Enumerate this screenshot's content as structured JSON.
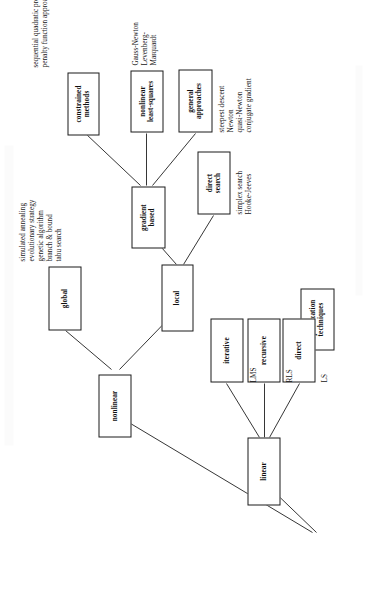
{
  "figure": {
    "orientation": "rotated-90-ccw",
    "root": {
      "id": "root",
      "label": "optimization\ntechniques"
    },
    "nodes": [
      {
        "id": "root",
        "label": "optimization\ntechniques"
      },
      {
        "id": "linear",
        "label": "linear"
      },
      {
        "id": "nonlinear",
        "label": "nonlinear"
      },
      {
        "id": "lin-direct",
        "label": "direct"
      },
      {
        "id": "lin-recursive",
        "label": "recursive"
      },
      {
        "id": "lin-iterative",
        "label": "iterative"
      },
      {
        "id": "global",
        "label": "global"
      },
      {
        "id": "local",
        "label": "local"
      },
      {
        "id": "dir-search",
        "label": "direct\nsearch"
      },
      {
        "id": "grad-based",
        "label": "gradient\nbased"
      },
      {
        "id": "gen-approach",
        "label": "general\napproaches"
      },
      {
        "id": "nl-lsq",
        "label": "nonlinear\nleast-squares"
      },
      {
        "id": "constrained",
        "label": "constrained\nmethods"
      }
    ],
    "leaves": {
      "lin_direct": "LS",
      "lin_recursive": "RLS",
      "lin_iterative": "LMS",
      "global": "simulated annealing\nevolutionary strategy\ngenetic algorithm\nbranch & bound\ntabu search",
      "direct_search": "simplex search\nHooke-Jeeves",
      "general_approaches": "steepest descent\nNewton\nquasi-Newton\nconjugate gradient",
      "nonlinear_least_squares": "Gauss-Newton\nLevenberg-\nMarquardt",
      "constrained_methods": "sequential quadratic programming\npenalty function approaches"
    },
    "edges": [
      {
        "from": "root",
        "to": "linear"
      },
      {
        "from": "root",
        "to": "nonlinear"
      },
      {
        "from": "linear",
        "to": "lin-direct"
      },
      {
        "from": "linear",
        "to": "lin-recursive"
      },
      {
        "from": "linear",
        "to": "lin-iterative"
      },
      {
        "from": "nonlinear",
        "to": "global"
      },
      {
        "from": "nonlinear",
        "to": "local"
      },
      {
        "from": "local",
        "to": "dir-search"
      },
      {
        "from": "local",
        "to": "grad-based"
      },
      {
        "from": "grad-based",
        "to": "gen-approach"
      },
      {
        "from": "grad-based",
        "to": "nl-lsq"
      },
      {
        "from": "grad-based",
        "to": "constrained"
      }
    ],
    "colors": {
      "line": "#1f1f1f",
      "box_fill": "#ffffff",
      "text": "#101010",
      "page": "#ffffff"
    }
  }
}
